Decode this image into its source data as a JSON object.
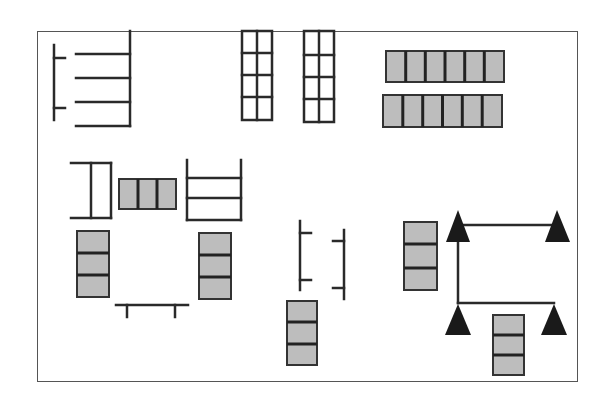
{
  "diagram": {
    "type": "floor-plan-layout",
    "frame": {
      "x": 37,
      "y": 31,
      "width": 541,
      "height": 351
    },
    "colors": {
      "line": "#2a2a2a",
      "block_fill": "#bdbdbd",
      "triangle": "#1a1a1a",
      "background": "#ffffff"
    },
    "elements": [
      {
        "id": "rack-top-left",
        "kind": "line-rack",
        "shelves": 4
      },
      {
        "id": "grid-top-1",
        "kind": "grid",
        "cols": 2,
        "rows": 4
      },
      {
        "id": "grid-top-2",
        "kind": "grid",
        "cols": 2,
        "rows": 4
      },
      {
        "id": "block-row-top-1",
        "kind": "block-row",
        "cells": 6
      },
      {
        "id": "block-row-top-2",
        "kind": "block-row",
        "cells": 6
      },
      {
        "id": "bracket-mid-left",
        "kind": "bracket"
      },
      {
        "id": "block-row-mid",
        "kind": "block-row",
        "cells": 3
      },
      {
        "id": "rack-mid",
        "kind": "line-rack",
        "shelves": 3
      },
      {
        "id": "block-col-left",
        "kind": "block-column",
        "cells": 3
      },
      {
        "id": "block-col-mid-left",
        "kind": "block-column",
        "cells": 3
      },
      {
        "id": "bench-bottom",
        "kind": "bench"
      },
      {
        "id": "tick-rail-1",
        "kind": "tick-rail"
      },
      {
        "id": "tick-rail-2",
        "kind": "tick-rail"
      },
      {
        "id": "block-col-bottom-mid",
        "kind": "block-column",
        "cells": 3
      },
      {
        "id": "block-col-right",
        "kind": "block-column",
        "cells": 3
      },
      {
        "id": "triangle-network",
        "kind": "triangle-network",
        "triangles": 4
      },
      {
        "id": "block-col-bottom-right",
        "kind": "block-column",
        "cells": 3
      }
    ]
  }
}
